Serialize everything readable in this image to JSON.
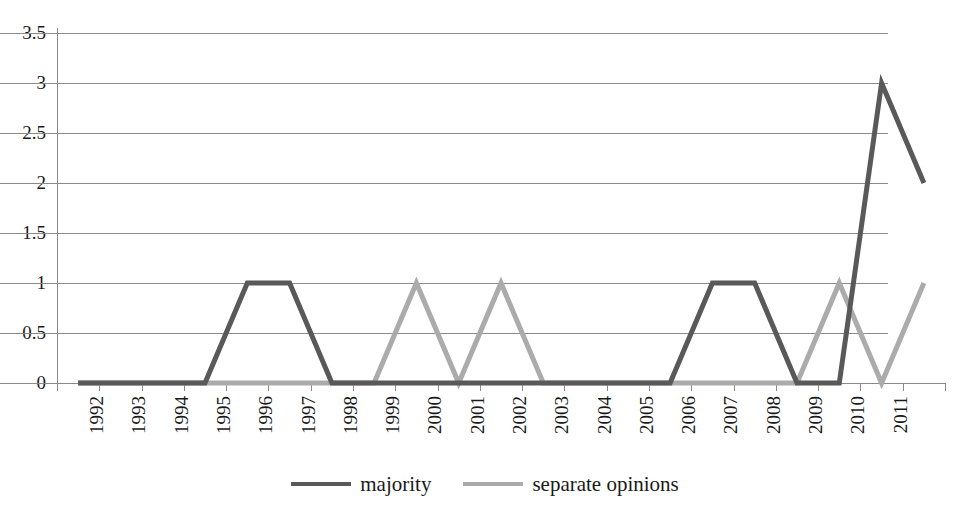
{
  "chart_data": {
    "type": "line",
    "title": "",
    "xlabel": "",
    "ylabel": "",
    "ylim": [
      0,
      3.5
    ],
    "ytick_values": [
      0,
      0.5,
      1,
      1.5,
      2,
      2.5,
      3,
      3.5
    ],
    "ytick_labels": [
      "0",
      "0.5",
      "1",
      "1.5",
      "2",
      "2.5",
      "3",
      "3.5"
    ],
    "grid": "horizontal",
    "legend_position": "bottom-center",
    "categories": [
      "1992",
      "1993",
      "1994",
      "1995",
      "1996",
      "1997",
      "1998",
      "1999",
      "2000",
      "2001",
      "2002",
      "2003",
      "2004",
      "2005",
      "2006",
      "2007",
      "2008",
      "2009",
      "2010",
      "2011",
      ""
    ],
    "xtick_labels": [
      "1992",
      "1993",
      "1994",
      "1995",
      "1996",
      "1997",
      "1998",
      "1999",
      "2000",
      "2001",
      "2002",
      "2003",
      "2004",
      "2005",
      "2006",
      "2007",
      "2008",
      "2009",
      "2010",
      "2011"
    ],
    "series": [
      {
        "name": "majority",
        "color": "#595959",
        "values": [
          0,
          0,
          0,
          0,
          1,
          1,
          0,
          0,
          0,
          0,
          0,
          0,
          0,
          0,
          0,
          1,
          1,
          0,
          0,
          3,
          2
        ]
      },
      {
        "name": "separate opinions",
        "color": "#ababab",
        "values": [
          0,
          0,
          0,
          0,
          0,
          0,
          0,
          0,
          1,
          0,
          1,
          0,
          0,
          0,
          0,
          0,
          0,
          0,
          1,
          0,
          1
        ]
      }
    ]
  },
  "legend": {
    "items": [
      {
        "label": "majority",
        "color": "#595959"
      },
      {
        "label": "separate opinions",
        "color": "#ababab"
      }
    ]
  },
  "colors": {
    "axis": "#8a8a8a",
    "grid": "#8a8a8a",
    "text": "#1a1a1a",
    "background": "#ffffff"
  }
}
